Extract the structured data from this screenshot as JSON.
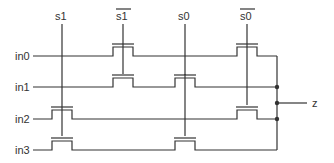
{
  "diagram": {
    "select_lines": [
      {
        "id": "s1",
        "label": "s1",
        "inverted": false
      },
      {
        "id": "s1bar",
        "label": "s1",
        "inverted": true
      },
      {
        "id": "s0",
        "label": "s0",
        "inverted": false
      },
      {
        "id": "s0bar",
        "label": "s0",
        "inverted": true
      }
    ],
    "inputs": [
      {
        "id": "in0",
        "label": "in0"
      },
      {
        "id": "in1",
        "label": "in1"
      },
      {
        "id": "in2",
        "label": "in2"
      },
      {
        "id": "in3",
        "label": "in3"
      }
    ],
    "output": {
      "id": "z",
      "label": "z"
    },
    "transistors": [
      {
        "input": "in0",
        "gates": [
          "s1bar",
          "s0bar"
        ]
      },
      {
        "input": "in1",
        "gates": [
          "s1bar",
          "s0"
        ]
      },
      {
        "input": "in2",
        "gates": [
          "s1",
          "s0bar"
        ]
      },
      {
        "input": "in3",
        "gates": [
          "s1",
          "s0"
        ]
      }
    ],
    "colors": {
      "line": "#333333",
      "background": "#ffffff"
    }
  }
}
